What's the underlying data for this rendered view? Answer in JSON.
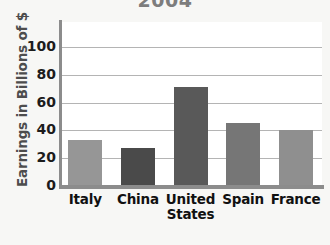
{
  "chart_data": {
    "type": "bar",
    "title": "2004",
    "xlabel": "",
    "ylabel": "Earnings in Billions of $",
    "categories": [
      "Italy",
      "China",
      "United States",
      "Spain",
      "France"
    ],
    "category_lines": [
      [
        "Italy"
      ],
      [
        "China"
      ],
      [
        "United",
        "States"
      ],
      [
        "Spain"
      ],
      [
        "France"
      ]
    ],
    "values": [
      33,
      27,
      71,
      45,
      40
    ],
    "ylim": [
      0,
      118
    ],
    "yticks": [
      0,
      20,
      40,
      60,
      80,
      100
    ],
    "ytick_labels": [
      "0",
      "20",
      "40",
      "60",
      "80",
      "100"
    ],
    "grid": true,
    "legend": "none",
    "bar_colors": [
      "#969696",
      "#4a4a4a",
      "#595959",
      "#767676",
      "#8f8f8f"
    ],
    "plot_background": "#ffffff",
    "page_background": "#f7f7f5",
    "gridline_color": "#b4b4b4",
    "axis_color": "#8c8c8c",
    "title_color": "#7d7d7d"
  }
}
